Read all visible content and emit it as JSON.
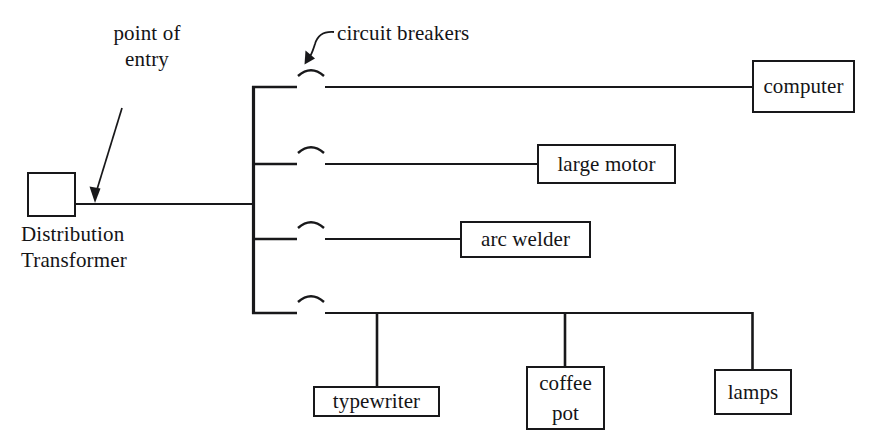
{
  "diagram": {
    "ink_color": "#18181a",
    "background_color": "#ffffff",
    "source": {
      "label": "Distribution\nTransformer",
      "label_line1": "Distribution",
      "label_line2": "Transformer"
    },
    "annotations": [
      {
        "id": "point-of-entry",
        "line1": "point of",
        "line2": "entry",
        "text": "point of entry",
        "arrow": "straight-diagonal-down-left"
      },
      {
        "id": "circuit-breakers",
        "text": "circuit breakers",
        "arrow": "curved-hook-down-left"
      }
    ],
    "bus": {
      "name": "vertical bus",
      "branch_count": 4
    },
    "branches": [
      {
        "index": 1,
        "breaker": "circuit-breaker-arc",
        "load": "computer"
      },
      {
        "index": 2,
        "breaker": "circuit-breaker-arc",
        "load": "large motor"
      },
      {
        "index": 3,
        "breaker": "circuit-breaker-arc",
        "load": "arc welder"
      },
      {
        "index": 4,
        "breaker": "circuit-breaker-arc",
        "loads": [
          "typewriter",
          "coffee pot",
          "lamps"
        ]
      }
    ],
    "loads": {
      "computer": "computer",
      "large_motor": "large motor",
      "arc_welder": "arc welder",
      "typewriter": "typewriter",
      "coffee_pot_line1": "coffee",
      "coffee_pot_line2": "pot",
      "coffee_pot": "coffee pot",
      "lamps": "lamps"
    }
  }
}
